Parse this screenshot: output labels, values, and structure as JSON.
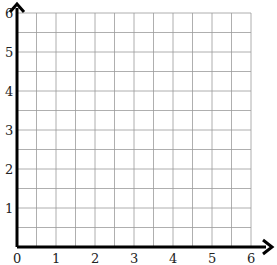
{
  "diagram": {
    "type": "coordinate-grid",
    "x_axis": {
      "min": 0,
      "max": 6,
      "tick_labels": [
        "0",
        "1",
        "2",
        "3",
        "4",
        "5",
        "6"
      ]
    },
    "y_axis": {
      "min": 0,
      "max": 6,
      "tick_labels": [
        "1",
        "2",
        "3",
        "4",
        "5",
        "6"
      ]
    },
    "grid": {
      "cells_per_unit": 2,
      "cells_x": 12,
      "cells_y": 12
    },
    "colors": {
      "grid": "#9a9a9a",
      "axis": "#000000",
      "label": "#222222",
      "background": "#ffffff"
    }
  }
}
